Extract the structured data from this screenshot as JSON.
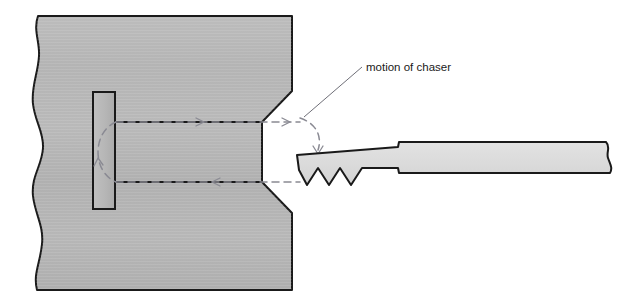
{
  "figure": {
    "background_color": "#ffffff"
  },
  "annotations": [
    {
      "id": "motion-of-chaser",
      "text": "motion of chaser",
      "text_x": 366,
      "text_y": 71,
      "leader_from": [
        363,
        66
      ],
      "leader_to": [
        303,
        118
      ]
    }
  ],
  "parts": {
    "workpiece": {
      "name": "workpiece",
      "fill_color": "#b2b2b2",
      "stroke_color": "#1a1a1a",
      "description": "sectioned block with counterbored and chamfered hole",
      "top": 16,
      "bottom": 290,
      "left": 36,
      "right": 292
    },
    "counterbore_shoulder": {
      "name": "counterbore-shoulder",
      "fill_color": "#b6b6b6",
      "stroke_color": "#1a1a1a",
      "x": 93,
      "y": 92,
      "width": 22,
      "height": 117
    },
    "chaser": {
      "name": "chaser-tool",
      "fill_color": "#dcdcdc",
      "stroke_color": "#1a1a1a",
      "teeth_count": 6,
      "tip_x": 297,
      "tail_x": 614
    }
  },
  "motion_path": {
    "name": "chaser-motion-loop",
    "stroke_color": "#8a8a93",
    "style": "dashed",
    "arrows": [
      {
        "at": [
          200,
          122
        ],
        "direction": "right"
      },
      {
        "at": [
          215,
          183
        ],
        "direction": "left"
      },
      {
        "at": [
          98,
          158
        ],
        "direction": "up"
      },
      {
        "at": [
          286,
          122
        ],
        "direction": "right"
      },
      {
        "at": [
          318,
          152
        ],
        "direction": "down"
      }
    ],
    "top_y": 122,
    "bottom_y": 183,
    "left_x": 116,
    "right_x": 292
  },
  "colors": {
    "workpiece_gray": "#b2b2b2",
    "chaser_gray": "#dcdcdc",
    "outline": "#1a1a1a",
    "motion_dash": "#8a8a93",
    "leader": "#6f6f78",
    "text": "#1a1a1a"
  }
}
